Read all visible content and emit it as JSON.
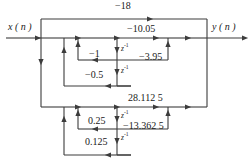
{
  "figure": {
    "type": "signal-flow-graph",
    "stroke_color": "#3c3c3c",
    "text_color": "#1a1a1a",
    "background": "#ffffff"
  },
  "io": {
    "input_label": "x ( n )",
    "output_label": "y ( n )"
  },
  "delay_label": {
    "text": "z",
    "exponent": "-1"
  },
  "coefficients": {
    "feedforward_top": "−18",
    "section1_gain": "−10.05",
    "section1_b1": "−3.95",
    "section1_a1": "−1",
    "section1_a2": "−0.5",
    "section2_gain": "28.112 5",
    "section2_b1": "−13.362 5",
    "section2_a1": "0.25",
    "section2_a2": "0.125"
  },
  "labels": [
    {
      "name": "input-label",
      "text": "x ( n )",
      "x": 8,
      "y": 27
    },
    {
      "name": "output-label",
      "text": "y ( n )",
      "x": 212,
      "y": 27
    },
    {
      "name": "coef-minus-18",
      "text": "−18",
      "x": 115,
      "y": 3
    },
    {
      "name": "coef-minus-10-05",
      "text": "−10.05",
      "x": 127,
      "y": 28
    },
    {
      "name": "coef-minus-1",
      "text": "−1",
      "x": 89,
      "y": 52
    },
    {
      "name": "coef-minus-3-95",
      "text": "−3.95",
      "x": 140,
      "y": 55
    },
    {
      "name": "coef-minus-0-5",
      "text": "−0.5",
      "x": 86,
      "y": 72
    },
    {
      "name": "coef-28-1125",
      "text": "28.112 5",
      "x": 129,
      "y": 96
    },
    {
      "name": "coef-0-25",
      "text": "0.25",
      "x": 88,
      "y": 119
    },
    {
      "name": "coef-minus-13-3625",
      "text": "−13.362 5",
      "x": 124,
      "y": 124
    },
    {
      "name": "coef-0-125",
      "text": "0.125",
      "x": 85,
      "y": 140
    }
  ],
  "delays": [
    {
      "name": "delay-z1-section1-first",
      "x": 121,
      "y": 46
    },
    {
      "name": "delay-z1-section1-second",
      "x": 121,
      "y": 68
    },
    {
      "name": "delay-z1-section2-first",
      "x": 121,
      "y": 113
    },
    {
      "name": "delay-z1-section2-second",
      "x": 121,
      "y": 135
    }
  ]
}
